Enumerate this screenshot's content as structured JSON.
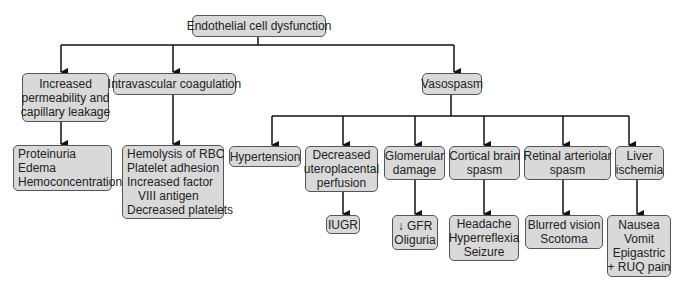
{
  "diagram": {
    "title": "Endothelial cell dysfunction",
    "level1": [
      {
        "id": "permeability",
        "lines": [
          "Increased",
          "permeability and",
          "capillary leakage"
        ]
      },
      {
        "id": "coagulation",
        "lines": [
          "Intravascular coagulation"
        ]
      },
      {
        "id": "vasospasm",
        "lines": [
          "Vasospasm"
        ]
      }
    ],
    "level2_vasospasm": [
      {
        "id": "hypertension",
        "lines": [
          "Hypertension"
        ]
      },
      {
        "id": "uteroplacental",
        "lines": [
          "Decreased",
          "uteroplacental",
          "perfusion"
        ]
      },
      {
        "id": "glomerular",
        "lines": [
          "Glomerular",
          "damage"
        ]
      },
      {
        "id": "cortical",
        "lines": [
          "Cortical brain",
          "spasm"
        ]
      },
      {
        "id": "retinal",
        "lines": [
          "Retinal arteriolar",
          "spasm"
        ]
      },
      {
        "id": "liver",
        "lines": [
          "Liver",
          "ischemia"
        ]
      }
    ],
    "outcomes": {
      "permeability": [
        "Proteinuria",
        "Edema",
        "Hemoconcentration"
      ],
      "coagulation": [
        "Hemolysis of RBC",
        "Platelet adhesion",
        "Increased factor",
        "VIII antigen",
        "Decreased platelets"
      ],
      "uteroplacental": [
        "IUGR"
      ],
      "glomerular": [
        "↓ GFR",
        "Oliguria"
      ],
      "cortical": [
        "Headache",
        "Hyperreflexia",
        "Seizure"
      ],
      "retinal": [
        "Blurred vision",
        "Scotoma"
      ],
      "liver": [
        "Nausea",
        "Vomit",
        "Epigastric",
        "+ RUQ pain"
      ]
    },
    "colors": {
      "box_fill": "#d9d9d9",
      "box_border": "#555555",
      "line": "#111111",
      "text": "#222222"
    }
  }
}
